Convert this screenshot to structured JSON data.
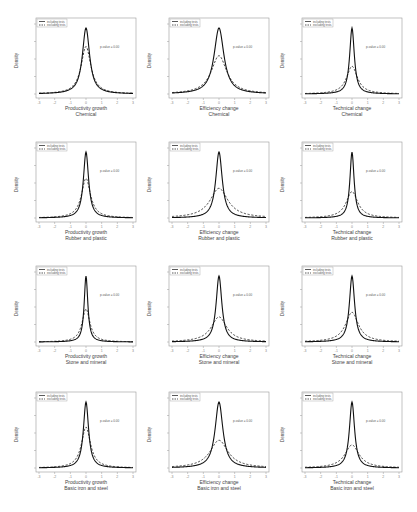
{
  "legend": {
    "solid": "including tests",
    "dashed": "excluding tests"
  },
  "annotation": "p-value = 0.00",
  "ylabel": "Density",
  "chart_data": [
    {
      "type": "line",
      "row": 0,
      "col": 0,
      "xlabel": "Productivity growth",
      "sector": "Chemical",
      "ylabel": "Density",
      "xlim": [
        -3,
        3
      ],
      "series": [
        {
          "name": "including tests",
          "peak": 1.0,
          "width": 0.28
        },
        {
          "name": "excluding tests",
          "peak": 0.72,
          "width": 0.38
        }
      ],
      "annotation": "p-value = 0.00"
    },
    {
      "type": "line",
      "row": 0,
      "col": 1,
      "xlabel": "Efficiency change",
      "sector": "Chemical",
      "ylabel": "Density",
      "xlim": [
        -3,
        3
      ],
      "series": [
        {
          "name": "including tests",
          "peak": 1.0,
          "width": 0.38
        },
        {
          "name": "excluding tests",
          "peak": 0.58,
          "width": 0.6
        }
      ],
      "annotation": "p-value = 0.00"
    },
    {
      "type": "line",
      "row": 0,
      "col": 2,
      "xlabel": "Technical change",
      "sector": "Chemical",
      "ylabel": "Density",
      "xlim": [
        -3,
        3
      ],
      "series": [
        {
          "name": "including tests",
          "peak": 1.0,
          "width": 0.18
        },
        {
          "name": "excluding tests",
          "peak": 0.42,
          "width": 0.42
        }
      ],
      "annotation": "p-value = 0.00"
    },
    {
      "type": "line",
      "row": 1,
      "col": 0,
      "xlabel": "Productivity growth",
      "sector": "Rubber and plastic",
      "ylabel": "Density",
      "xlim": [
        -3,
        3
      ],
      "series": [
        {
          "name": "including tests",
          "peak": 1.0,
          "width": 0.2
        },
        {
          "name": "excluding tests",
          "peak": 0.6,
          "width": 0.35
        }
      ],
      "annotation": "p-value = 0.00"
    },
    {
      "type": "line",
      "row": 1,
      "col": 1,
      "xlabel": "Efficiency change",
      "sector": "Rubber and plastic",
      "ylabel": "Density",
      "xlim": [
        -3,
        3
      ],
      "series": [
        {
          "name": "including tests",
          "peak": 1.0,
          "width": 0.25
        },
        {
          "name": "excluding tests",
          "peak": 0.45,
          "width": 0.7
        }
      ],
      "annotation": "p-value = 0.00"
    },
    {
      "type": "line",
      "row": 1,
      "col": 2,
      "xlabel": "Technical change",
      "sector": "Rubber and plastic",
      "ylabel": "Density",
      "xlim": [
        -3,
        3
      ],
      "series": [
        {
          "name": "including tests",
          "peak": 1.0,
          "width": 0.16
        },
        {
          "name": "excluding tests",
          "peak": 0.4,
          "width": 0.45
        }
      ],
      "annotation": "p-value = 0.00"
    },
    {
      "type": "line",
      "row": 2,
      "col": 0,
      "xlabel": "Productivity growth",
      "sector": "Stone and mineral",
      "ylabel": "Density",
      "xlim": [
        -3,
        3
      ],
      "series": [
        {
          "name": "including tests",
          "peak": 1.0,
          "width": 0.14
        },
        {
          "name": "excluding tests",
          "peak": 0.5,
          "width": 0.3
        }
      ],
      "annotation": "p-value = 0.00"
    },
    {
      "type": "line",
      "row": 2,
      "col": 1,
      "xlabel": "Efficiency change",
      "sector": "Stone and mineral",
      "ylabel": "Density",
      "xlim": [
        -3,
        3
      ],
      "series": [
        {
          "name": "including tests",
          "peak": 1.0,
          "width": 0.22
        },
        {
          "name": "excluding tests",
          "peak": 0.38,
          "width": 0.6
        }
      ],
      "annotation": "p-value = 0.00"
    },
    {
      "type": "line",
      "row": 2,
      "col": 2,
      "xlabel": "Technical change",
      "sector": "Stone and mineral",
      "ylabel": "Density",
      "xlim": [
        -3,
        3
      ],
      "series": [
        {
          "name": "including tests",
          "peak": 1.0,
          "width": 0.2
        },
        {
          "name": "excluding tests",
          "peak": 0.45,
          "width": 0.5
        }
      ],
      "annotation": "p-value = 0.00"
    },
    {
      "type": "line",
      "row": 3,
      "col": 0,
      "xlabel": "Productivity growth",
      "sector": "Basic iron and steel",
      "ylabel": "Density",
      "xlim": [
        -3,
        3
      ],
      "series": [
        {
          "name": "including tests",
          "peak": 1.0,
          "width": 0.2
        },
        {
          "name": "excluding tests",
          "peak": 0.62,
          "width": 0.35
        }
      ],
      "annotation": "p-value = 0.00"
    },
    {
      "type": "line",
      "row": 3,
      "col": 1,
      "xlabel": "Efficiency change",
      "sector": "Basic iron and steel",
      "ylabel": "Density",
      "xlim": [
        -3,
        3
      ],
      "series": [
        {
          "name": "including tests",
          "peak": 1.0,
          "width": 0.3
        },
        {
          "name": "excluding tests",
          "peak": 0.42,
          "width": 0.7
        }
      ],
      "annotation": "p-value = 0.00"
    },
    {
      "type": "line",
      "row": 3,
      "col": 2,
      "xlabel": "Technical change",
      "sector": "Basic iron and steel",
      "ylabel": "Density",
      "xlim": [
        -3,
        3
      ],
      "series": [
        {
          "name": "including tests",
          "peak": 1.0,
          "width": 0.2
        },
        {
          "name": "excluding tests",
          "peak": 0.35,
          "width": 0.55
        }
      ],
      "annotation": "p-value = 0.00"
    }
  ]
}
